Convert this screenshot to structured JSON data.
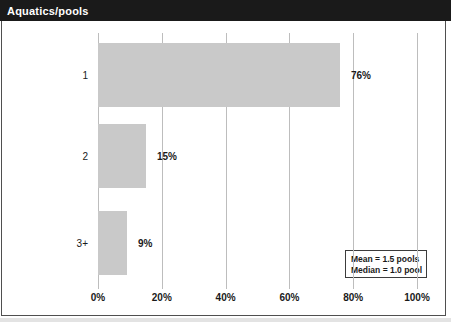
{
  "header": {
    "title": "Aquatics/pools"
  },
  "chart_data": {
    "type": "bar",
    "orientation": "horizontal",
    "title": "Aquatics/pools",
    "categories": [
      "1",
      "2",
      "3+"
    ],
    "values": [
      76,
      15,
      9
    ],
    "value_labels": [
      "76%",
      "15%",
      "9%"
    ],
    "xlabel": "",
    "ylabel": "",
    "xlim": [
      0,
      100
    ],
    "x_tick_values": [
      0,
      20,
      40,
      60,
      80,
      100
    ],
    "x_tick_labels": [
      "0%",
      "20%",
      "40%",
      "60%",
      "80%",
      "100%"
    ],
    "grid": "vertical gridlines on",
    "legend_position": "bottom-right",
    "annotations": [
      "Mean = 1.5 pools",
      "Median = 1.0 pool"
    ]
  },
  "legend": {
    "mean_label": "Mean = 1.5 pools",
    "median_label": "Median = 1.0 pool"
  },
  "colors": {
    "title_bar_bg": "#1a1a1a",
    "title_text": "#ffffff",
    "bar_fill": "#c9c9c9",
    "gridline": "#bdbdbd",
    "frame_border": "#4f4f4f",
    "text": "#1a1a1a"
  }
}
